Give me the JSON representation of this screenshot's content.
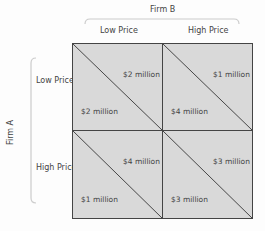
{
  "firm_b": {
    "label": "Firm B",
    "strategies": [
      "Low Price",
      "High Price"
    ]
  },
  "firm_a": {
    "label": "Firm A",
    "strategies": [
      "Low Price",
      "High Price"
    ]
  },
  "payoffs": [
    [
      {
        "firm_b": "$2 million",
        "firm_a": "$2 million"
      },
      {
        "firm_b": "$1 million",
        "firm_a": "$4 million"
      }
    ],
    [
      {
        "firm_b": "$4 million",
        "firm_a": "$1 million"
      },
      {
        "firm_b": "$3 million",
        "firm_a": "$3 million"
      }
    ]
  ],
  "colors": {
    "cell_fill": "#d9d9d9",
    "grid_line": "#444444",
    "bracket": "#cccccc"
  }
}
